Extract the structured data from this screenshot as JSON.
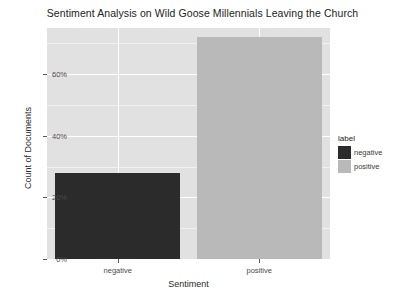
{
  "chart_data": {
    "type": "bar",
    "title": "Sentiment Analysis on Wild Goose Millennials Leaving the Church",
    "xlabel": "Sentiment",
    "ylabel": "Count of Documents",
    "categories": [
      "negative",
      "positive"
    ],
    "values": [
      28,
      72
    ],
    "value_format": "percent",
    "ylim": [
      0,
      75
    ],
    "yticks": [
      0,
      20,
      40,
      60
    ],
    "ytick_labels": [
      "0%",
      "20%",
      "40%",
      "60%"
    ],
    "grid": true,
    "legend": {
      "title": "label",
      "position": "right",
      "entries": [
        {
          "label": "negative",
          "color": "#2b2b2b"
        },
        {
          "label": "positive",
          "color": "#b9b9b9"
        }
      ]
    },
    "colors": {
      "negative": "#2b2b2b",
      "positive": "#b9b9b9",
      "panel_background": "#e1e1e1",
      "gridline": "#ffffff",
      "page_background": "#ffffff",
      "text": "#2e2e2e"
    }
  }
}
